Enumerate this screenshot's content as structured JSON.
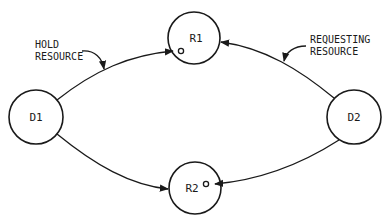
{
  "diagram": {
    "type": "resource-allocation-graph",
    "nodes": [
      {
        "id": "D1",
        "label": "D1",
        "kind": "process"
      },
      {
        "id": "R1",
        "label": "R1",
        "kind": "resource"
      },
      {
        "id": "R2",
        "label": "R2",
        "kind": "resource"
      },
      {
        "id": "D2",
        "label": "D2",
        "kind": "process"
      }
    ],
    "edges": [
      {
        "from": "D1",
        "to": "R1",
        "meaning": "hold"
      },
      {
        "from": "D1",
        "to": "R2",
        "meaning": "request"
      },
      {
        "from": "D2",
        "to": "R1",
        "meaning": "request"
      },
      {
        "from": "D2",
        "to": "R2",
        "meaning": "hold"
      }
    ],
    "annotations": [
      {
        "line1": "HOLD",
        "line2": "RESOURCE"
      },
      {
        "line1": "REQUESTING",
        "line2": "RESOURCE"
      }
    ],
    "colors": {
      "stroke": "#1a1a1a",
      "background": "#ffffff"
    }
  }
}
